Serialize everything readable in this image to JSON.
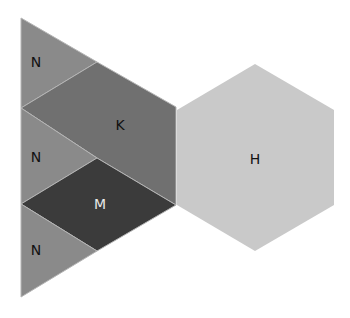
{
  "diagram": {
    "type": "tangram-shapes",
    "shapes": [
      {
        "id": "n-top",
        "label": "N",
        "kind": "triangle",
        "fill": "#8a8a8a",
        "text_color": "#111111",
        "points": "21,18 97,62 21,108",
        "label_pos": [
          36,
          62
        ]
      },
      {
        "id": "k",
        "label": "K",
        "kind": "pentagon",
        "fill": "#707070",
        "text_color": "#111111",
        "points": "21,108 97,62 176,107 176,205 97,158",
        "label_pos": [
          120,
          125
        ]
      },
      {
        "id": "n-middle",
        "label": "N",
        "kind": "triangle",
        "fill": "#8a8a8a",
        "text_color": "#111111",
        "points": "21,108 97,158 21,204",
        "label_pos": [
          36,
          157
        ]
      },
      {
        "id": "m",
        "label": "M",
        "kind": "rhombus",
        "fill": "#3b3b3b",
        "text_color": "#e8e8e8",
        "points": "21,204 97,158 176,205 97,251",
        "label_pos": [
          100,
          204
        ]
      },
      {
        "id": "n-bottom",
        "label": "N",
        "kind": "triangle",
        "fill": "#8a8a8a",
        "text_color": "#111111",
        "points": "21,204 97,251 21,297",
        "label_pos": [
          36,
          250
        ]
      },
      {
        "id": "h",
        "label": "H",
        "kind": "hexagon",
        "fill": "#c9c9c9",
        "text_color": "#111111",
        "points": "255,64 334,110 334,205 255,251 177,205 177,110",
        "label_pos": [
          255,
          159
        ]
      }
    ]
  }
}
